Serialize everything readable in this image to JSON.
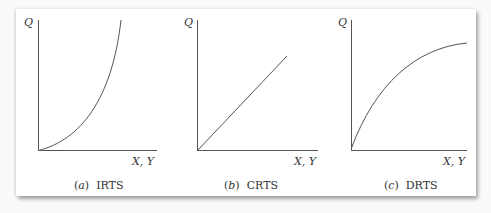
{
  "figure": {
    "panels": [
      {
        "id": "a",
        "letter": "a",
        "title": "IRTS",
        "y_label": "Q",
        "x_label": "X, Y",
        "curve": "convex"
      },
      {
        "id": "b",
        "letter": "b",
        "title": "CRTS",
        "y_label": "Q",
        "x_label": "X, Y",
        "curve": "linear"
      },
      {
        "id": "c",
        "letter": "c",
        "title": "DRTS",
        "y_label": "Q",
        "x_label": "X, Y",
        "curve": "concave"
      }
    ]
  },
  "colors": {
    "line": "#555555",
    "background": "#ffffff"
  }
}
